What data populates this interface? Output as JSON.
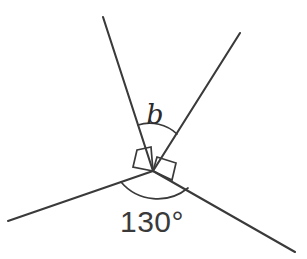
{
  "figure": {
    "background_color": "#ffffff",
    "line_color": "#3a3a3a",
    "width": 307,
    "height": 259
  },
  "vertex": {
    "label": "vertex",
    "x": 153,
    "y": 171
  },
  "rays": [
    {
      "name": "upper-left-ray",
      "x1": 153,
      "y1": 171,
      "x2": 103,
      "y2": 17
    },
    {
      "name": "upper-right-ray",
      "x1": 153,
      "y1": 171,
      "x2": 240,
      "y2": 33
    },
    {
      "name": "lower-left-ray",
      "x1": 153,
      "y1": 171,
      "x2": 8,
      "y2": 221
    },
    {
      "name": "lower-right-ray",
      "x1": 153,
      "y1": 171,
      "x2": 295,
      "y2": 252
    }
  ],
  "arcs": [
    {
      "name": "arc-angle-b",
      "path": "M 138 125 A 40 40 0 0 1 177 134"
    },
    {
      "name": "arc-angle-130",
      "path": "M 121 182 A 48 48 0 0 0 188 188"
    }
  ],
  "right_angle_markers": [
    {
      "name": "right-angle-marker-left",
      "points": "137,150 151,147 153,171 133,167"
    },
    {
      "name": "right-angle-marker-right",
      "points": "157,157 176,163 172,180 153,171"
    }
  ],
  "labels": {
    "unknown_angle": {
      "text": "b",
      "x": 155,
      "y": 124
    },
    "known_angle": {
      "text": "130°",
      "x": 152,
      "y": 232
    }
  },
  "chart_data": {
    "type": "diagram",
    "angles": [
      {
        "label": "b",
        "value": null,
        "unit": "degrees",
        "known": false
      },
      {
        "label": "right angle left",
        "value": 90,
        "unit": "degrees",
        "known": true
      },
      {
        "label": "right angle right",
        "value": 90,
        "unit": "degrees",
        "known": true
      },
      {
        "label": "130°",
        "value": 130,
        "unit": "degrees",
        "known": true
      }
    ],
    "total_around_point": 360
  }
}
